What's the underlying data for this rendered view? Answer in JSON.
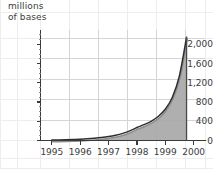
{
  "chart_data": {
    "type": "area",
    "title": "",
    "ylabel": "millions\nof bases",
    "ylabel_lines": [
      "millions",
      "of bases"
    ],
    "xlabel": "",
    "xlim": [
      1994.6,
      2000.4
    ],
    "ylim": [
      0,
      2300
    ],
    "yticks": [
      0,
      400,
      800,
      1200,
      1600,
      2000
    ],
    "ytick_labels": [
      "0",
      "400",
      "800",
      "1,200",
      "1,600",
      "2,000"
    ],
    "xticks": [
      1995,
      1996,
      1997,
      1998,
      1999,
      2000
    ],
    "xtick_labels": [
      "1995",
      "1996",
      "1997",
      "1998",
      "1999",
      "2000"
    ],
    "grid": true,
    "legend": "none",
    "x": [
      1995.0,
      1995.25,
      1995.5,
      1995.75,
      1996.0,
      1996.25,
      1996.5,
      1996.75,
      1997.0,
      1997.25,
      1997.5,
      1997.75,
      1998.0,
      1998.25,
      1998.5,
      1998.75,
      1999.0,
      1999.25,
      1999.5,
      1999.75
    ],
    "values": [
      10,
      13,
      17,
      22,
      28,
      36,
      47,
      62,
      82,
      110,
      148,
      200,
      270,
      330,
      400,
      500,
      650,
      900,
      1350,
      2150
    ],
    "series": [
      {
        "name": "bases",
        "values": [
          10,
          13,
          17,
          22,
          28,
          36,
          47,
          62,
          82,
          110,
          148,
          200,
          270,
          330,
          400,
          500,
          650,
          900,
          1350,
          2150
        ]
      }
    ],
    "end_drop_to_baseline": true,
    "colors": {
      "fill": "#a8a8a8",
      "outline": "#2e2e2e",
      "inner_line": "#8e8e8e",
      "grid": "#d2d2d2",
      "bg_grid": "#ececec",
      "axis": "#3a3a3a",
      "text": "#3c3c3c",
      "background": "#ffffff"
    }
  }
}
